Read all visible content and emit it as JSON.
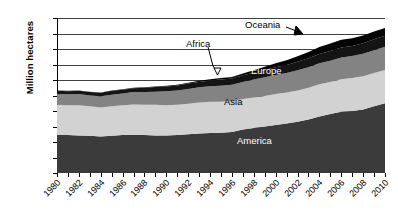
{
  "chart_data": {
    "type": "area",
    "title": "",
    "xlabel": "",
    "ylabel": "Million hectares",
    "ylim": [
      0,
      200
    ],
    "ytick_step": 20,
    "grid": true,
    "legend_position": "inline-labels",
    "stacked": true,
    "yticks": [
      "200",
      "180",
      "160",
      "140",
      "120",
      "100",
      "80",
      "60",
      "40",
      "20",
      "0"
    ],
    "x": [
      1980,
      1981,
      1982,
      1983,
      1984,
      1985,
      1986,
      1987,
      1988,
      1989,
      1990,
      1991,
      1992,
      1993,
      1994,
      1995,
      1996,
      1997,
      1998,
      1999,
      2000,
      2001,
      2002,
      2003,
      2004,
      2005,
      2006,
      2007,
      2008,
      2009,
      2010
    ],
    "xtick_labels": [
      "1980",
      "1982",
      "1984",
      "1986",
      "1988",
      "1990",
      "1992",
      "1994",
      "1996",
      "1998",
      "2000",
      "2002",
      "2004",
      "2006",
      "2008",
      "2010"
    ],
    "series": [
      {
        "name": "America",
        "color": "#3b3b3b",
        "label_text": "America",
        "values": [
          49,
          49,
          48.5,
          48,
          47,
          48,
          49,
          49.5,
          49,
          48.5,
          48.5,
          49,
          50,
          51,
          51.5,
          52,
          53,
          56,
          58,
          60,
          62,
          64,
          66,
          69,
          73,
          76,
          79,
          80,
          82,
          86,
          90
        ]
      },
      {
        "name": "Asia",
        "color": "#d2d2d2",
        "label_text": "Asia",
        "values": [
          39,
          38.5,
          39,
          38,
          37.5,
          38,
          38.5,
          39,
          39,
          39.5,
          39,
          39,
          39.5,
          40,
          40.5,
          40,
          40,
          39.5,
          39.5,
          39.5,
          40,
          40,
          40.5,
          41,
          41.5,
          41.5,
          42,
          42.5,
          43,
          43,
          43
        ]
      },
      {
        "name": "Europe",
        "color": "#838383",
        "label_text": "Europe",
        "values": [
          14,
          14,
          14.5,
          14,
          14.5,
          15,
          15,
          16,
          16.5,
          17,
          18,
          18.5,
          19,
          19.5,
          20,
          20.5,
          21,
          22,
          23,
          24,
          24.5,
          25,
          26,
          26.5,
          27,
          27.5,
          28,
          28.5,
          29,
          29.5,
          30
        ]
      },
      {
        "name": "Africa",
        "color": "#141414",
        "label_text": "Africa",
        "values": [
          4,
          4,
          4,
          4.5,
          4.5,
          5,
          5,
          5,
          5.5,
          6,
          6,
          6.5,
          7,
          7,
          7.5,
          8,
          8,
          8.5,
          9,
          9.5,
          10,
          10.5,
          11,
          11.5,
          12,
          12.5,
          13,
          13,
          13.5,
          14,
          14
        ]
      },
      {
        "name": "Oceania",
        "color": "#050505",
        "label_text": "Oceania",
        "values": [
          0.5,
          0.5,
          0.5,
          0.5,
          0.5,
          0.5,
          0.5,
          0.5,
          0.5,
          0.5,
          1,
          1,
          1,
          1.5,
          1.5,
          2,
          2,
          2.5,
          3,
          4,
          5,
          6,
          7,
          8,
          9,
          9.5,
          10,
          10,
          10,
          10,
          10
        ]
      }
    ],
    "callouts": [
      {
        "name": "Africa",
        "text": "Africa"
      },
      {
        "name": "Oceania",
        "text": "Oceania"
      }
    ]
  }
}
